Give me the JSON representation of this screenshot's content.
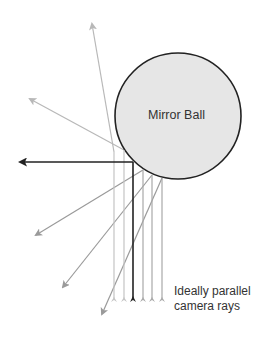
{
  "diagram": {
    "ball_label": "Mirror Ball",
    "caption_line1": "Ideally parallel",
    "caption_line2": "camera rays",
    "colors": {
      "ball_fill": "#e6e6e6",
      "ball_stroke": "#222222",
      "highlight_ray": "#222222",
      "light_ray": "#b8b8b8",
      "mid_ray": "#9a9a9a"
    },
    "ball": {
      "cx": 178,
      "cy": 116,
      "r": 63
    },
    "rays": [
      {
        "name": "ray-1",
        "x": 114,
        "hit_y": 152,
        "reflect_to": [
          92,
          24
        ],
        "color": "#b8b8b8"
      },
      {
        "name": "ray-2",
        "x": 124,
        "hit_y": 150,
        "reflect_to": [
          30,
          99
        ],
        "color": "#b8b8b8"
      },
      {
        "name": "ray-3",
        "x": 133,
        "hit_y": 162,
        "reflect_to": [
          16,
          162
        ],
        "color": "#222222"
      },
      {
        "name": "ray-4",
        "x": 143,
        "hit_y": 170,
        "reflect_to": [
          35,
          236
        ],
        "color": "#9a9a9a"
      },
      {
        "name": "ray-5",
        "x": 152,
        "hit_y": 175,
        "reflect_to": [
          62,
          288
        ],
        "color": "#9a9a9a"
      },
      {
        "name": "ray-6",
        "x": 162,
        "hit_y": 178,
        "reflect_to": [
          101,
          316
        ],
        "color": "#9a9a9a"
      }
    ]
  }
}
